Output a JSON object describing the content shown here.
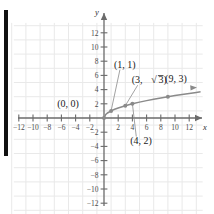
{
  "chart_data": {
    "type": "line",
    "title": "",
    "subtitle": "",
    "xlabel": "x",
    "ylabel": "y",
    "xlim": [
      -13.5,
      14.5
    ],
    "ylim": [
      -13.5,
      13.5
    ],
    "grid": true,
    "grid_step": 2,
    "legend": "none",
    "function": "y = sqrt(x)",
    "x_ticks": [
      -12,
      -10,
      -8,
      -6,
      -4,
      -2,
      2,
      4,
      6,
      8,
      10,
      12
    ],
    "x_tick_labels": [
      "-12",
      "-10",
      "-8",
      "-6",
      "-4",
      "-2",
      "2",
      "4",
      "6",
      "8",
      "10",
      "12"
    ],
    "y_ticks": [
      12,
      10,
      8,
      6,
      4,
      2,
      -2,
      -4,
      -6,
      -8,
      -10,
      -12
    ],
    "y_tick_labels": [
      "12",
      "10",
      "8",
      "6",
      "4",
      "2",
      "-2",
      "-4",
      "-6",
      "-8",
      "-10",
      "-12"
    ],
    "series": [
      {
        "name": "sqrt",
        "x": [
          0,
          0.25,
          0.5,
          1,
          1.5,
          2,
          3,
          4,
          5,
          6,
          7,
          8,
          9,
          10,
          11,
          12,
          13,
          13.6
        ],
        "values": [
          0,
          0.5,
          0.707,
          1,
          1.225,
          1.414,
          1.732,
          2,
          2.236,
          2.449,
          2.646,
          2.828,
          3,
          3.162,
          3.317,
          3.464,
          3.606,
          3.688
        ]
      }
    ],
    "points": [
      {
        "id": "origin",
        "x": 0,
        "y": 0,
        "label": "(0, 0)",
        "label_x": -6.6,
        "label_y": 1.6,
        "has_leader": false
      },
      {
        "id": "p1",
        "x": 1,
        "y": 1,
        "label": "(1, 1)",
        "label_x": 1.4,
        "label_y": 7.1,
        "has_leader": true
      },
      {
        "id": "p3",
        "x": 3,
        "y": 1.732,
        "label_prefix": "(3, ",
        "label_radical": "3",
        "label_suffix": ")",
        "label_x": 3.9,
        "label_y": 4.9,
        "has_leader": true,
        "is_radical": true
      },
      {
        "id": "p4",
        "x": 4,
        "y": 2,
        "label": "(4, 2)",
        "label_x": 3.7,
        "label_y": -3.6,
        "has_leader": true
      },
      {
        "id": "p9",
        "x": 9,
        "y": 3,
        "label": "(9, 3)",
        "label_x": 8.6,
        "label_y": 5.1,
        "has_leader": false
      }
    ],
    "annotations": [
      "(0, 0)",
      "(1, 1)",
      "(3, √3)",
      "(4, 2)",
      "(9, 3)"
    ]
  },
  "colors": {
    "curve": "#8a8a8a",
    "axis": "#6b6b6b",
    "grid": "#e9e9e9",
    "label": "#1a1a1a",
    "background": "#ffffff",
    "edge_bar": "#111111"
  }
}
